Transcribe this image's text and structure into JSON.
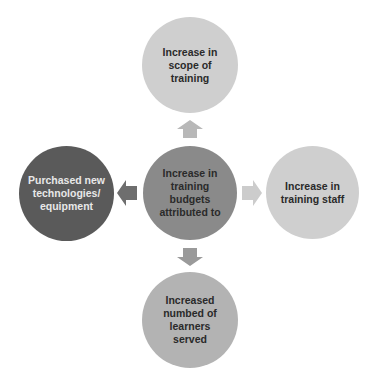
{
  "diagram": {
    "center": {
      "label": "Increase in training budgets attributed to",
      "color": "#8a8a8a",
      "text_color": "#2a2a2a"
    },
    "top": {
      "label": "Increase in scope of training",
      "color": "#cfcfcf",
      "text_color": "#2a2a2a"
    },
    "right": {
      "label": "Increase in training staff",
      "color": "#cfcfcf",
      "text_color": "#2a2a2a"
    },
    "bottom": {
      "label": "Increased numbed of learners served",
      "color": "#b3b3b3",
      "text_color": "#2a2a2a"
    },
    "left": {
      "label": "Purchased new technologies/ equipment",
      "color": "#5a5a5a",
      "text_color": "#e8e8e8"
    },
    "arrows": {
      "up": {
        "color": "#b8b8b8"
      },
      "right": {
        "color": "#cccccc"
      },
      "down": {
        "color": "#9a9a9a"
      },
      "left": {
        "color": "#6e6e6e"
      }
    }
  }
}
